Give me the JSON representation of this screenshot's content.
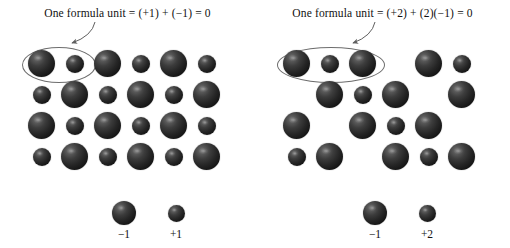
{
  "figure": {
    "width": 510,
    "height": 248,
    "background_color": "#ffffff",
    "sphere_color_dark": "#262626",
    "outline_color": "#6d6d6d",
    "text_color": "#111111"
  },
  "panels": [
    {
      "id": "left",
      "caption": "One formula unit = (+1) + (−1) = 0",
      "ratio": "1:1",
      "highlight_count": 2,
      "grid": {
        "rows": 4,
        "cols": 6,
        "x0": 42,
        "y0": 64,
        "dx": 33,
        "dy": 31,
        "pattern": [
          [
            "large",
            "small",
            "large",
            "small",
            "large",
            "small"
          ],
          [
            "small",
            "large",
            "small",
            "large",
            "small",
            "large"
          ],
          [
            "large",
            "small",
            "large",
            "small",
            "large",
            "small"
          ],
          [
            "small",
            "large",
            "small",
            "large",
            "small",
            "large"
          ]
        ]
      },
      "ellipse": {
        "cx": 58,
        "cy": 64,
        "rx": 36,
        "ry": 17
      },
      "arrow": {
        "x1": 95,
        "y1": 22,
        "cx": 92,
        "cy": 36,
        "x2": 70,
        "y2": 44
      },
      "legend": [
        {
          "charge": "−1",
          "size": "large",
          "cx": 124,
          "cy": 213
        },
        {
          "charge": "+1",
          "size": "small",
          "cx": 176,
          "cy": 215
        }
      ]
    },
    {
      "id": "right",
      "caption": "One formula unit = (+2) + (2)(−1) = 0",
      "ratio": "1:2",
      "highlight_count": 3,
      "grid": {
        "rows": 4,
        "cols": 6,
        "x0": 42,
        "y0": 64,
        "dx": 33,
        "dy": 31,
        "pattern": [
          [
            "large",
            "small",
            "large",
            "none",
            "large",
            "small"
          ],
          [
            "none",
            "large",
            "small",
            "large",
            "none",
            "large"
          ],
          [
            "large",
            "none",
            "large",
            "small",
            "large",
            "none"
          ],
          [
            "small",
            "large",
            "none",
            "large",
            "small",
            "large"
          ]
        ]
      },
      "ellipse": {
        "cx": 75,
        "cy": 64,
        "rx": 53,
        "ry": 17
      },
      "arrow": {
        "x1": 120,
        "y1": 22,
        "cx": 117,
        "cy": 36,
        "x2": 96,
        "y2": 44
      },
      "legend": [
        {
          "charge": "−1",
          "size": "large",
          "cx": 120,
          "cy": 213
        },
        {
          "charge": "+2",
          "size": "small",
          "cx": 172,
          "cy": 215
        }
      ]
    }
  ],
  "sphere_sizes": {
    "large": 27,
    "small": 18,
    "legend_large": 24,
    "legend_small": 17
  }
}
